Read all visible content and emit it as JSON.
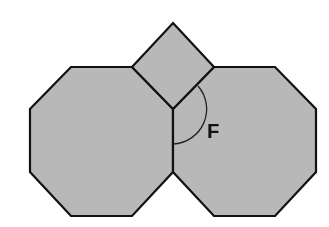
{
  "diagram": {
    "type": "geometry",
    "colors": {
      "fill": "#b8b8b8",
      "stroke": "#111111",
      "background": "#ffffff"
    },
    "shapes": [
      {
        "name": "left-octagon",
        "points": "71,67 132,67 173,109 173,172 132,216 71,216 30,172 30,109"
      },
      {
        "name": "right-octagon",
        "points": "214,67 275,67 316,109 316,172 275,216 214,216 173,172 173,109"
      },
      {
        "name": "square",
        "points": "173,23 214,67 173,109 132,67"
      }
    ],
    "angle": {
      "label": "F",
      "vertex": [
        173,
        109
      ],
      "arc_path": "M 198 86 A 35 35 0 0 1 173 144"
    }
  }
}
